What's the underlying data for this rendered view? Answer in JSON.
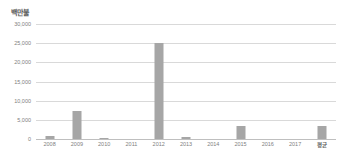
{
  "chart_data": {
    "type": "bar",
    "title": "",
    "subtitle": "",
    "xlabel": "",
    "ylabel": "백만불",
    "categories": [
      "2008",
      "2009",
      "2010",
      "2011",
      "2012",
      "2013",
      "2014",
      "2015",
      "2016",
      "2017",
      "평균"
    ],
    "values": [
      800,
      7200,
      150,
      0,
      25000,
      500,
      0,
      3400,
      0,
      0,
      3300
    ],
    "ylim": [
      0,
      30000
    ],
    "yticks": [
      0,
      5000,
      10000,
      15000,
      20000,
      25000,
      30000
    ],
    "ytick_labels": [
      "0",
      "5,000",
      "10,000",
      "15,000",
      "20,000",
      "25,000",
      "30,000"
    ],
    "grid": true,
    "legend": false,
    "legend_position": "none",
    "series": [
      {
        "name": "",
        "values": [
          800,
          7200,
          150,
          0,
          25000,
          500,
          0,
          3400,
          0,
          0,
          3300
        ]
      }
    ]
  },
  "colors": {
    "bar": "#a6a6a6",
    "gridline": "#d9d9d9",
    "baseline": "#bfbfbf",
    "tick_text": "#808080",
    "axis_label_text": "#595959",
    "background": "#ffffff"
  }
}
